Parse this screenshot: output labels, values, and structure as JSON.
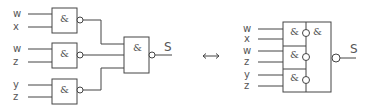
{
  "diagram": {
    "left_circuit": {
      "gates": [
        {
          "symbol": "&",
          "inputs": [
            "w",
            "x"
          ],
          "negated_output": true
        },
        {
          "symbol": "&",
          "inputs": [
            "w",
            "z"
          ],
          "negated_output": true
        },
        {
          "symbol": "&",
          "inputs": [
            "y",
            "z"
          ],
          "negated_output": true
        }
      ],
      "final_gate": {
        "symbol": "&",
        "negated_output": true
      },
      "output_label": "S"
    },
    "equivalence_symbol": "↔",
    "right_block": {
      "inputs": [
        "w",
        "x",
        "w",
        "z",
        "y",
        "z"
      ],
      "sub_gates": [
        "&",
        "&",
        "&"
      ],
      "combining_symbol": "&",
      "output_label": "S"
    },
    "colors": {
      "line": "#444444",
      "text": "#555555",
      "background": "#ffffff"
    }
  }
}
